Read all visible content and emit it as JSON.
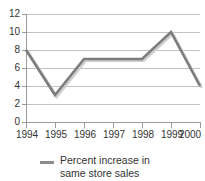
{
  "chart_data": {
    "type": "line",
    "title": "",
    "xlabel": "",
    "ylabel": "",
    "categories": [
      "1994",
      "1995",
      "1996",
      "1997",
      "1998",
      "1999",
      "2000"
    ],
    "series": [
      {
        "name": "Percent increase in same store sales",
        "values": [
          8,
          3,
          7,
          7,
          7,
          10,
          4
        ],
        "color": "#7d7d7d"
      }
    ],
    "ylim": [
      0,
      12
    ],
    "ytick_labels": [
      "12",
      "10",
      "8",
      "6",
      "4",
      "2",
      "0"
    ],
    "ytick_values": [
      12,
      10,
      8,
      6,
      4,
      2,
      0
    ],
    "grid": true,
    "legend_position": "bottom"
  },
  "legend": {
    "label_line1": "Percent increase in",
    "label_line2": "same store sales",
    "marker_name": "line-marker"
  },
  "colors": {
    "line": "#7d7d7d",
    "line_highlight": "#cfcfcf",
    "gridline": "#c2c2c2",
    "axis": "#9a9a9a",
    "text": "#333333"
  }
}
